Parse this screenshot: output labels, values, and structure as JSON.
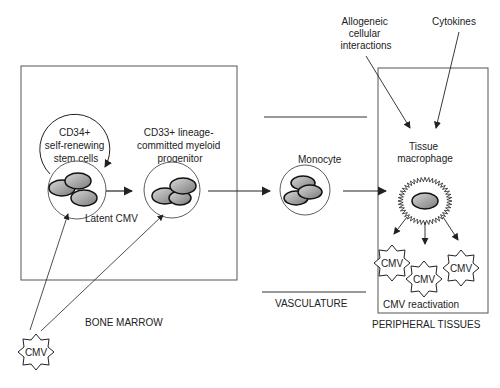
{
  "labels": {
    "cd34": [
      "CD34+",
      "self-renewing",
      "stem cells"
    ],
    "cd33": [
      "CD33+ lineage-",
      "committed myeloid",
      "progenitor"
    ],
    "latent": "Latent CMV",
    "monocyte": "Monocyte",
    "macrophage": [
      "Tissue",
      "macrophage"
    ],
    "allogeneic": [
      "Allogeneic",
      "cellular",
      "interactions"
    ],
    "cytokines": "Cytokines",
    "reactivation": "CMV reactivation",
    "cmv": "CMV"
  },
  "sections": {
    "bone_marrow": "BONE MARROW",
    "vasculature": "VASCULATURE",
    "peripheral": "PERIPHERAL TISSUES"
  }
}
